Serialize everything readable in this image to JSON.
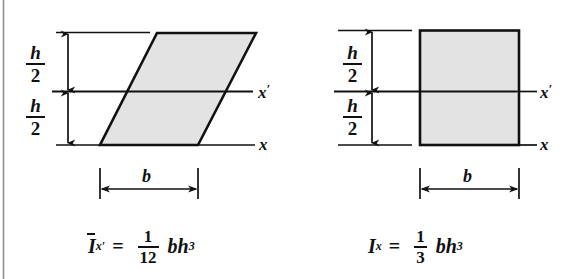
{
  "page": {
    "background": "#ffffff",
    "ink": "#111111",
    "shape_fill": "#e3e3e3",
    "width": 576,
    "height": 279,
    "scan_edge_visible": true
  },
  "figures": [
    {
      "id": "parallelogram",
      "shape": "parallelogram",
      "fill": "#e3e3e3",
      "stroke": "#111111",
      "dimensions": {
        "upper_half": {
          "numerator": "h",
          "denominator": "2"
        },
        "lower_half": {
          "numerator": "h",
          "denominator": "2"
        },
        "width_label": "b"
      },
      "axes": [
        {
          "name": "centroidal-axis",
          "label": "x",
          "prime": true
        },
        {
          "name": "base-axis",
          "label": "x",
          "prime": false
        }
      ],
      "formula": {
        "symbol": "I",
        "overbar": true,
        "subscript": "x",
        "subscript_prime": true,
        "equals": "=",
        "fraction": {
          "numerator": "1",
          "denominator": "12"
        },
        "expression": "bh",
        "exponent": "3",
        "plain": "I̅x' = (1/12) bh³"
      }
    },
    {
      "id": "rectangle",
      "shape": "rectangle",
      "fill": "#e3e3e3",
      "stroke": "#111111",
      "dimensions": {
        "upper_half": {
          "numerator": "h",
          "denominator": "2"
        },
        "lower_half": {
          "numerator": "h",
          "denominator": "2"
        },
        "width_label": "b"
      },
      "axes": [
        {
          "name": "centroidal-axis",
          "label": "x",
          "prime": true
        },
        {
          "name": "base-axis",
          "label": "x",
          "prime": false
        }
      ],
      "formula": {
        "symbol": "I",
        "overbar": false,
        "subscript": "x",
        "subscript_prime": false,
        "equals": "=",
        "fraction": {
          "numerator": "1",
          "denominator": "3"
        },
        "expression": "bh",
        "exponent": "3",
        "plain": "Ix = (1/3) bh³"
      }
    }
  ]
}
